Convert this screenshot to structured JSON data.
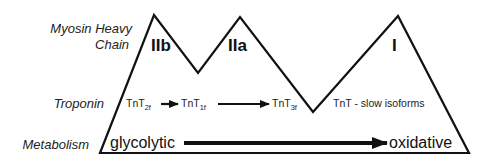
{
  "row_labels": {
    "myosin_line1": "Myosin Heavy",
    "myosin_line2": "Chain",
    "troponin": "Troponin",
    "metabolism": "Metabolism"
  },
  "fiber_types": [
    "IIb",
    "IIa",
    "I"
  ],
  "troponin": {
    "isoforms": [
      {
        "base": "TnT",
        "sub": "2f"
      },
      {
        "base": "TnT",
        "sub": "1f"
      },
      {
        "base": "TnT",
        "sub": "3f"
      }
    ],
    "slow": "TnT - slow isoforms"
  },
  "metabolism": {
    "start": "glycolytic",
    "end": "oxidative"
  },
  "colors": {
    "line": "#111111",
    "text": "#222222",
    "background": "#ffffff"
  }
}
